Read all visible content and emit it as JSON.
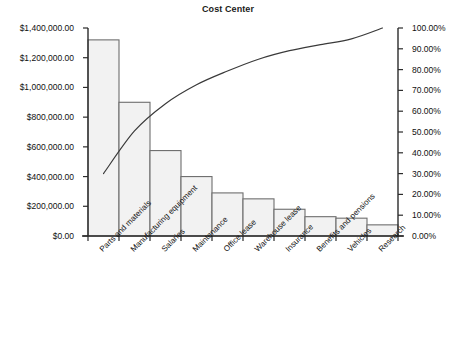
{
  "chart_data": {
    "type": "bar",
    "title": "Cost Center",
    "xlabel": "",
    "ylabel": "",
    "grid": false,
    "legend": "none",
    "categories": [
      "Parts and materials",
      "Manufacturing equipment",
      "Salaries",
      "Maintenance",
      "Office lease",
      "Warehouse lease",
      "Insurance",
      "Benefits and pensions",
      "Vehicles",
      "Research"
    ],
    "series": [
      {
        "name": "Cost",
        "type": "bar",
        "axis": "left",
        "values": [
          1320000,
          900000,
          575000,
          400000,
          290000,
          250000,
          180000,
          130000,
          120000,
          75000
        ]
      },
      {
        "name": "Cumulative percentage",
        "type": "line",
        "axis": "right",
        "values": [
          30.0,
          50.5,
          63.6,
          72.7,
          79.3,
          85.0,
          89.1,
          92.0,
          94.8,
          100.0
        ]
      }
    ],
    "ylim": [
      0,
      1400000
    ],
    "y2lim": [
      0,
      100
    ],
    "ytick_labels": [
      "$0.00",
      "$200,000.00",
      "$400,000.00",
      "$600,000.00",
      "$800,000.00",
      "$1,000,000.00",
      "$1,200,000.00",
      "$1,400,000.00"
    ],
    "ytick_values": [
      0,
      200000,
      400000,
      600000,
      800000,
      1000000,
      1200000,
      1400000
    ],
    "y2tick_labels": [
      "0.00%",
      "10.00%",
      "20.00%",
      "30.00%",
      "40.00%",
      "50.00%",
      "60.00%",
      "70.00%",
      "80.00%",
      "90.00%",
      "100.00%"
    ],
    "y2tick_values": [
      0,
      10,
      20,
      30,
      40,
      50,
      60,
      70,
      80,
      90,
      100
    ],
    "colors": {
      "bar_fill": "#f2f2f2",
      "bar_stroke": "#6e6e6e",
      "line_stroke": "#3a3a3a",
      "axis": "#2b2b2b",
      "text": "#111111",
      "background": "#ffffff"
    }
  }
}
